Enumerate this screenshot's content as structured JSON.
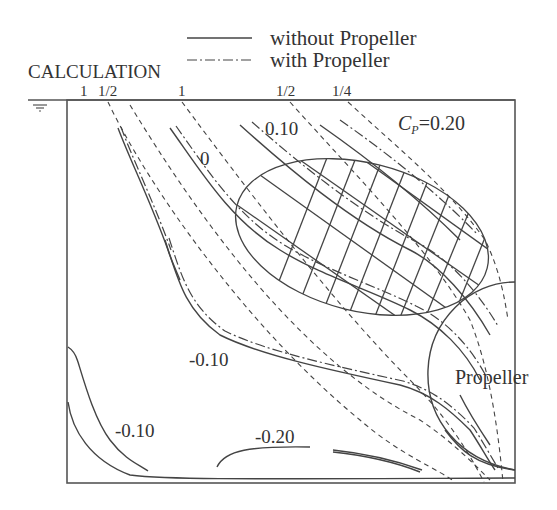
{
  "legend": {
    "items": [
      {
        "label": "without Propeller",
        "style": "solid"
      },
      {
        "label": "with Propeller",
        "style": "dash-dot"
      }
    ]
  },
  "header": {
    "calculation_label": "CALCULATION",
    "top_ticks": [
      "1",
      "1/2",
      "1",
      "1/2",
      "1/4"
    ]
  },
  "contour_labels": {
    "cp_title": "C",
    "cp_sub": "P",
    "cp_value": "=0.20",
    "c010": "0.10",
    "c0": "0",
    "cm010_mid": "-0.10",
    "cm010_low": "-0.10",
    "cm020": "-0.20"
  },
  "annotations": {
    "propeller": "Propeller",
    "water_surface_symbol": "water-surface-icon"
  },
  "colors": {
    "line": "#444444",
    "background": "#ffffff"
  }
}
